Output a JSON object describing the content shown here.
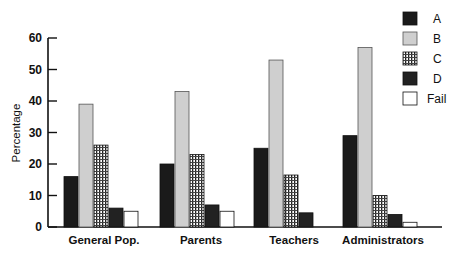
{
  "chart_data": {
    "type": "bar",
    "title": "",
    "xlabel": "",
    "ylabel": "Percentage",
    "ylim": [
      0,
      60
    ],
    "yticks": [
      0,
      10,
      20,
      30,
      40,
      50,
      60
    ],
    "grid": false,
    "legend_position": "top-right",
    "categories": [
      "General Pop.",
      "Parents",
      "Teachers",
      "Administrators"
    ],
    "series": [
      {
        "name": "A",
        "values": [
          16,
          20,
          25,
          29
        ],
        "fill": "#1a1a1a",
        "pattern": "solid-black"
      },
      {
        "name": "B",
        "values": [
          39,
          43,
          53,
          57
        ],
        "fill": "#cfcfcf",
        "pattern": "solid-light-gray"
      },
      {
        "name": "C",
        "values": [
          26,
          23,
          16.5,
          10
        ],
        "fill": "#ffffff",
        "pattern": "crosshatch"
      },
      {
        "name": "D",
        "values": [
          6,
          7,
          4.5,
          4
        ],
        "fill": "#222222",
        "pattern": "solid-dark"
      },
      {
        "name": "Fail",
        "values": [
          5,
          5,
          0,
          1.5
        ],
        "fill": "#ffffff",
        "pattern": "hollow"
      }
    ]
  }
}
